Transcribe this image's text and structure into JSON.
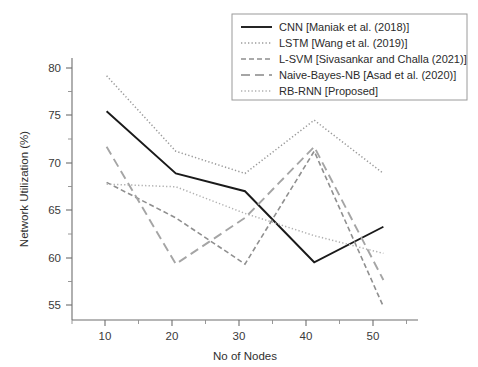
{
  "chart_data": {
    "type": "line",
    "title": "",
    "xlabel": "No of Nodes",
    "ylabel": "Network Utilization (%)",
    "x": [
      10,
      20,
      30,
      40,
      50
    ],
    "xlim": [
      5,
      55
    ],
    "ylim": [
      52.5,
      82
    ],
    "xticks": [
      "10",
      "20",
      "30",
      "40",
      "50"
    ],
    "yticks": [
      "55",
      "60",
      "65",
      "70",
      "75",
      "80"
    ],
    "grid": false,
    "legend_position": "upper right",
    "series": [
      {
        "name": "CNN [Maniak et al. (2018)]",
        "values": [
          76,
          69,
          67,
          59,
          63
        ],
        "color": "#1a1a1a",
        "style": "solid",
        "dash": "0",
        "width": 1.9
      },
      {
        "name": "LSTM [Wang et al. (2019)]",
        "values": [
          80,
          71.5,
          69,
          75,
          69
        ],
        "color": "#9a9a9a",
        "style": "dotted",
        "dash": "1.3 2.2",
        "width": 1.5
      },
      {
        "name": "L-SVM [Sivasankar and Challa (2021)]",
        "values": [
          68,
          64,
          58.8,
          71.5,
          54
        ],
        "color": "#8f8f8f",
        "style": "dash-dot",
        "dash": "5 3",
        "width": 1.6
      },
      {
        "name": "Naive-Bayes-NB [Asad et al. (2020)]",
        "values": [
          72,
          58.8,
          64,
          72,
          57
        ],
        "color": "#a5a5a5",
        "style": "long-dash",
        "dash": "9 5",
        "width": 1.9
      },
      {
        "name": "RB-RNN [Proposed]",
        "values": [
          67.8,
          67.5,
          64.5,
          62,
          60
        ],
        "color": "#b0b0b0",
        "style": "dotted",
        "dash": "1.3 2.2",
        "width": 1.5
      }
    ]
  }
}
